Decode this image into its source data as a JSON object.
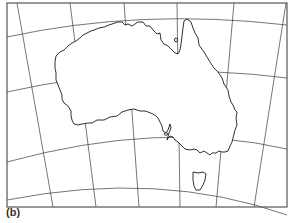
{
  "figure": {
    "label": "(b)",
    "colors": {
      "background": "#ffffff",
      "frame": "#555555",
      "graticule": "#3a3a3a",
      "coastline": "#1a1a1a"
    }
  },
  "map": {
    "frame": {
      "x": 7,
      "y": 3,
      "width": 280,
      "height": 204
    },
    "parallels": [
      "M7,37 Q140,8 287,25",
      "M7,92 Q150,60 287,78",
      "M7,162 Q160,120 287,149",
      "M7,200 Q160,170 287,215"
    ],
    "meridians": [
      "M17,3 L53,207",
      "M70,3 L96,207",
      "M124,3 L139,207",
      "M177,3 L180,207",
      "M234,3 L216,207",
      "M286,3 L254,207"
    ],
    "features": [
      {
        "name": "Australia mainland"
      },
      {
        "name": "Tasmania"
      }
    ]
  }
}
